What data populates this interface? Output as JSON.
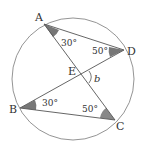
{
  "diagram": {
    "type": "circle-geometry",
    "circle": {
      "cx": 73,
      "cy": 79,
      "r": 61,
      "stroke": "#777777"
    },
    "points": {
      "A": {
        "x": 44,
        "y": 24,
        "label": "A",
        "lx": 35,
        "ly": 21
      },
      "D": {
        "x": 124,
        "y": 50,
        "label": "D",
        "lx": 127,
        "ly": 55
      },
      "B": {
        "x": 20,
        "y": 108,
        "label": "B",
        "lx": 9,
        "ly": 113
      },
      "C": {
        "x": 115,
        "y": 120,
        "label": "C",
        "lx": 116,
        "ly": 130
      },
      "E": {
        "x": 80,
        "y": 76,
        "label": "E",
        "lx": 68,
        "ly": 75
      }
    },
    "segments": [
      "AD",
      "AC",
      "BD",
      "BC"
    ],
    "angles": {
      "A": {
        "value": "30°",
        "lx": 61,
        "ly": 46
      },
      "D": {
        "value": "50°",
        "lx": 92,
        "ly": 54
      },
      "B": {
        "value": "30°",
        "lx": 42,
        "ly": 106
      },
      "C": {
        "value": "50°",
        "lx": 82,
        "ly": 112
      }
    },
    "variable": {
      "label": "b",
      "lx": 95,
      "ly": 82
    },
    "shade_color": "#777777",
    "line_color": "#555555"
  }
}
